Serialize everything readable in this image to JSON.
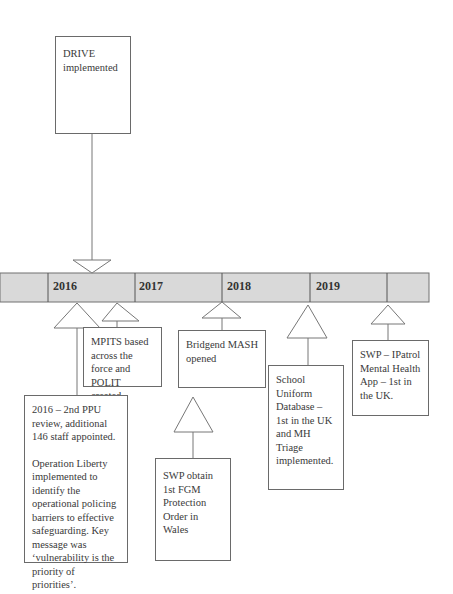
{
  "timeline": {
    "bar_color": "#d9d9d9",
    "years": [
      {
        "label": "2016"
      },
      {
        "label": "2017"
      },
      {
        "label": "2018"
      },
      {
        "label": "2019"
      }
    ]
  },
  "events": {
    "drive": {
      "text": "DRIVE implemented"
    },
    "mpits": {
      "text": "MPITS based across the force and POLIT created."
    },
    "ppu_review": {
      "para1": "2016 – 2nd PPU review, additional 146 staff appointed.",
      "para2": "Operation Liberty implemented to identify the operational policing barriers to effective safeguarding. Key message was ‘vulnerability is the priority of priorities’."
    },
    "bridgend_mash": {
      "text": "Bridgend MASH opened"
    },
    "fgm_order": {
      "text": "SWP obtain 1st FGM Protection Order in Wales"
    },
    "school_uniform": {
      "text": "School Uniform Database – 1st in the UK and MH Triage implemented."
    },
    "ipatrol": {
      "text": "SWP – IPatrol Mental Health App – 1st in the UK."
    }
  }
}
